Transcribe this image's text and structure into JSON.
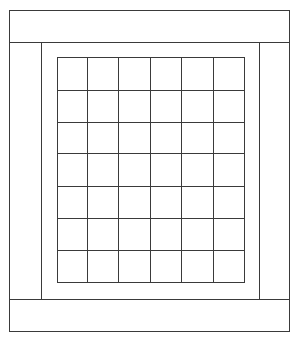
{
  "diagram": {
    "type": "quilt-layout",
    "line_color": "#3a3a3a",
    "outer_border": {
      "x": 9,
      "y": 10,
      "width": 280,
      "height": 321
    },
    "top_band": {
      "x": 9,
      "y": 10,
      "width": 280,
      "height": 32
    },
    "bottom_band": {
      "x": 9,
      "y": 299,
      "width": 280,
      "height": 32
    },
    "left_band": {
      "x": 9,
      "y": 42,
      "width": 32,
      "height": 257
    },
    "right_band": {
      "x": 259,
      "y": 42,
      "width": 30,
      "height": 257
    },
    "inner_frame": {
      "x": 41,
      "y": 42,
      "width": 218,
      "height": 257
    },
    "grid": {
      "x": 57,
      "y": 57,
      "width": 187,
      "height": 225,
      "columns": 6,
      "rows": 7,
      "col_lines": [
        57,
        87,
        118,
        150,
        181,
        213,
        244
      ],
      "row_lines": [
        57,
        90,
        122,
        153,
        186,
        218,
        250,
        282
      ]
    }
  }
}
